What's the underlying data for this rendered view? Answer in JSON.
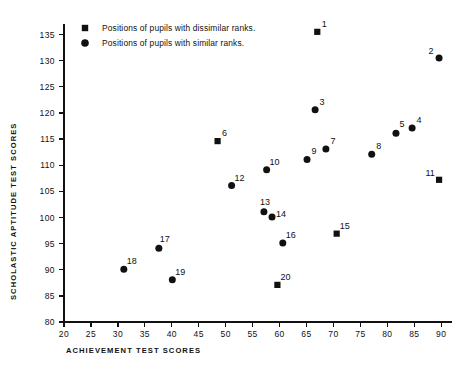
{
  "chart_data": {
    "type": "scatter",
    "title": "",
    "xlabel": "ACHIEVEMENT TEST SCORES",
    "ylabel": "SCHOLASTIC APTITUDE TEST SCORES",
    "xlim": [
      20,
      92
    ],
    "ylim": [
      80,
      137
    ],
    "xticks": [
      20,
      25,
      30,
      35,
      40,
      45,
      50,
      55,
      60,
      65,
      70,
      75,
      80,
      85,
      90
    ],
    "yticks": [
      80,
      85,
      90,
      95,
      100,
      105,
      110,
      115,
      120,
      125,
      130,
      135
    ],
    "grid": false,
    "legend_position": "top-left",
    "legend": [
      {
        "marker": "square",
        "label": "Positions of pupils with dissimilar ranks."
      },
      {
        "marker": "circle",
        "label": "Positions of pupils with similar ranks."
      }
    ],
    "series": [
      {
        "name": "Positions of pupils with dissimilar ranks.",
        "marker": "square",
        "points": [
          {
            "label": "1",
            "x": 67.0,
            "y": 135.5,
            "label_dx": 7,
            "label_dy": -5
          },
          {
            "label": "6",
            "x": 48.5,
            "y": 114.6,
            "label_dx": 7,
            "label_dy": -5
          },
          {
            "label": "11",
            "x": 89.6,
            "y": 107.2,
            "label_dx": -9,
            "label_dy": -4
          },
          {
            "label": "15",
            "x": 70.6,
            "y": 96.9,
            "label_dx": 8,
            "label_dy": -5
          },
          {
            "label": "20",
            "x": 59.6,
            "y": 87.1,
            "label_dx": 8,
            "label_dy": -5
          }
        ]
      },
      {
        "name": "Positions of pupils with similar ranks.",
        "marker": "circle",
        "points": [
          {
            "label": "2",
            "x": 89.6,
            "y": 130.5,
            "label_dx": -8,
            "label_dy": -4
          },
          {
            "label": "3",
            "x": 66.6,
            "y": 120.6,
            "label_dx": 7,
            "label_dy": -5
          },
          {
            "label": "4",
            "x": 84.6,
            "y": 117.1,
            "label_dx": 7,
            "label_dy": -5
          },
          {
            "label": "5",
            "x": 81.6,
            "y": 116.1,
            "label_dx": 6,
            "label_dy": -6
          },
          {
            "label": "7",
            "x": 68.6,
            "y": 113.1,
            "label_dx": 7,
            "label_dy": -5
          },
          {
            "label": "8",
            "x": 77.1,
            "y": 112.1,
            "label_dx": 7,
            "label_dy": -5
          },
          {
            "label": "9",
            "x": 65.1,
            "y": 111.1,
            "label_dx": 7,
            "label_dy": -5
          },
          {
            "label": "10",
            "x": 57.6,
            "y": 109.1,
            "label_dx": 8,
            "label_dy": -5
          },
          {
            "label": "12",
            "x": 51.1,
            "y": 106.1,
            "label_dx": 8,
            "label_dy": -5
          },
          {
            "label": "13",
            "x": 57.1,
            "y": 101.1,
            "label_dx": 1,
            "label_dy": -7
          },
          {
            "label": "14",
            "x": 58.6,
            "y": 100.1,
            "label_dx": 9,
            "label_dy": 0
          },
          {
            "label": "16",
            "x": 60.6,
            "y": 95.1,
            "label_dx": 8,
            "label_dy": -5
          },
          {
            "label": "17",
            "x": 37.6,
            "y": 94.1,
            "label_dx": 6,
            "label_dy": -6
          },
          {
            "label": "18",
            "x": 31.1,
            "y": 90.1,
            "label_dx": 8,
            "label_dy": -5
          },
          {
            "label": "19",
            "x": 40.1,
            "y": 88.1,
            "label_dx": 8,
            "label_dy": -5
          }
        ]
      }
    ]
  }
}
